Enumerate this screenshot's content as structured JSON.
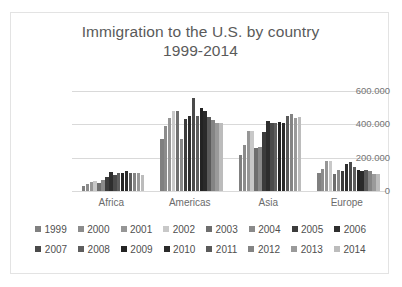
{
  "chart_data": {
    "type": "bar",
    "title": "Immigration to the U.S. by country",
    "subtitle": "1999-2014",
    "xlabel": "",
    "ylabel": "",
    "ylim": [
      0,
      600000
    ],
    "yticks": [
      0,
      200000,
      400000,
      600000
    ],
    "ytick_labels": [
      "0",
      "200.000",
      "400.000",
      "600.000"
    ],
    "grid": true,
    "legend_position": "bottom",
    "categories": [
      "Africa",
      "Americas",
      "Asia",
      "Europe"
    ],
    "series": [
      {
        "name": "1999",
        "color": "#808080",
        "values": [
          33000,
          312000,
          215000,
          106000
        ]
      },
      {
        "name": "2000",
        "color": "#8c8c8c",
        "values": [
          45000,
          393000,
          274000,
          134000
        ]
      },
      {
        "name": "2001",
        "color": "#969696",
        "values": [
          53000,
          436000,
          362000,
          178000
        ]
      },
      {
        "name": "2002",
        "color": "#c8c8c8",
        "values": [
          60000,
          478000,
          360000,
          180000
        ]
      },
      {
        "name": "2003",
        "color": "#6e6e6e",
        "values": [
          48000,
          478000,
          258000,
          101000
        ]
      },
      {
        "name": "2004",
        "color": "#8a8a8a",
        "values": [
          67000,
          310000,
          264000,
          128000
        ]
      },
      {
        "name": "2005",
        "color": "#3c3c3c",
        "values": [
          85000,
          432000,
          352000,
          120000
        ]
      },
      {
        "name": "2006",
        "color": "#2e2e2e",
        "values": [
          117000,
          448000,
          418000,
          165000
        ]
      },
      {
        "name": "2007",
        "color": "#4a4a4a",
        "values": [
          95000,
          559000,
          411000,
          176000
        ]
      },
      {
        "name": "2008",
        "color": "#5e5e5e",
        "values": [
          107000,
          450000,
          407000,
          145000
        ]
      },
      {
        "name": "2009",
        "color": "#232323",
        "values": [
          109000,
          500000,
          413000,
          128000
        ]
      },
      {
        "name": "2010",
        "color": "#2a2a2a",
        "values": [
          122000,
          483000,
          411000,
          121000
        ]
      },
      {
        "name": "2011",
        "color": "#5a5a5a",
        "values": [
          106000,
          443000,
          451000,
          126000
        ]
      },
      {
        "name": "2012",
        "color": "#848484",
        "values": [
          108000,
          429000,
          462000,
          118000
        ]
      },
      {
        "name": "2013",
        "color": "#9a9a9a",
        "values": [
          110000,
          411000,
          441000,
          105000
        ]
      },
      {
        "name": "2014",
        "color": "#bcbcbc",
        "values": [
          98000,
          410000,
          444000,
          104000
        ]
      }
    ]
  },
  "legend": {
    "rows": [
      [
        "1999",
        "2000",
        "2001",
        "2002",
        "2003",
        "2004",
        "2005",
        "2006"
      ],
      [
        "2007",
        "2008",
        "2009",
        "2010",
        "2011",
        "2012",
        "2013",
        "2014"
      ]
    ]
  }
}
